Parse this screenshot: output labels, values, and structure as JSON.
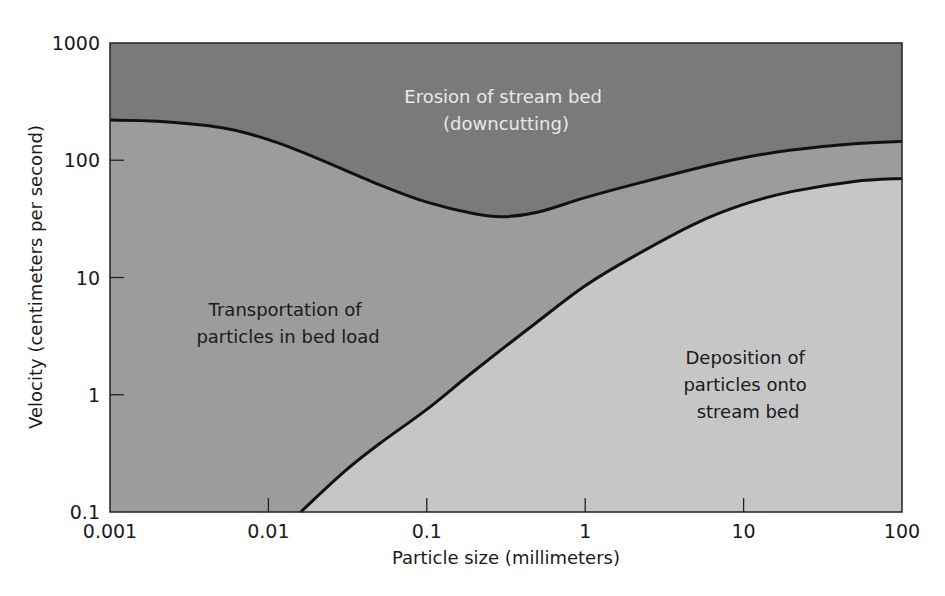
{
  "chart_data": {
    "type": "area",
    "title": "",
    "xlabel": "Particle size (millimeters)",
    "ylabel": "Velocity (centimeters per second)",
    "xscale": "log",
    "yscale": "log",
    "xlim": [
      0.001,
      100
    ],
    "ylim": [
      0.1,
      1000
    ],
    "x_ticks": [
      0.001,
      0.01,
      0.1,
      1,
      10,
      100
    ],
    "x_tick_labels": [
      "0.001",
      "0.01",
      "0.1",
      "1",
      "10",
      "100"
    ],
    "y_ticks": [
      0.1,
      1,
      10,
      100,
      1000
    ],
    "y_tick_labels": [
      "0.1",
      "1",
      "10",
      "100",
      "1000"
    ],
    "grid": false,
    "legend": null,
    "series": [
      {
        "name": "Erosion threshold (upper curve)",
        "x": [
          0.001,
          0.002,
          0.005,
          0.01,
          0.02,
          0.05,
          0.1,
          0.2,
          0.3,
          0.5,
          1,
          2,
          5,
          10,
          20,
          50,
          100
        ],
        "y": [
          220,
          215,
          190,
          150,
          105,
          62,
          44,
          35,
          33,
          36,
          48,
          62,
          85,
          105,
          122,
          138,
          145
        ]
      },
      {
        "name": "Deposition threshold (lower curve)",
        "x": [
          0.016,
          0.03,
          0.05,
          0.1,
          0.2,
          0.5,
          1,
          2,
          5,
          10,
          20,
          50,
          100
        ],
        "y": [
          0.1,
          0.22,
          0.38,
          0.75,
          1.6,
          4.2,
          8.5,
          15,
          29,
          42,
          54,
          66,
          70
        ]
      }
    ],
    "regions": [
      {
        "name": "erosion",
        "label_lines": [
          "Erosion of stream bed",
          "(downcutting)"
        ],
        "fill": "#7a7a7a"
      },
      {
        "name": "transportation",
        "label_lines": [
          "Transportation of",
          "particles in bed load"
        ],
        "fill": "#9c9c9c"
      },
      {
        "name": "deposition",
        "label_lines": [
          "Deposition of",
          "particles onto",
          "stream bed"
        ],
        "fill": "#c6c6c6"
      }
    ],
    "colors": {
      "curve": "#111111",
      "frame": "#222222",
      "background": "#ffffff"
    }
  }
}
